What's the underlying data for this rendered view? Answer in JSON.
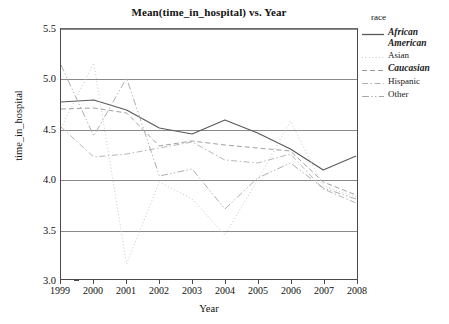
{
  "chart_data": {
    "type": "line",
    "title": "Mean(time_in_hospital) vs. Year",
    "xlabel": "Year",
    "ylabel": "time_in_hospital",
    "x": [
      1999,
      2000,
      2001,
      2002,
      2003,
      2004,
      2005,
      2006,
      2007,
      2008
    ],
    "xticklabels": [
      "1999",
      "2000",
      "2001",
      "2002",
      "2003",
      "2004",
      "2005",
      "2006",
      "2007",
      "2008"
    ],
    "yticklabels": [
      "3.0",
      "3.5",
      "4.0",
      "4.5",
      "5.0",
      "5.5"
    ],
    "ytickvalues": [
      3.0,
      3.5,
      4.0,
      4.5,
      5.0,
      5.5
    ],
    "xlim": [
      1999,
      2008
    ],
    "ylim": [
      3.0,
      5.5
    ],
    "grid": "horizontal",
    "legend_position": "right",
    "legend_title": "race",
    "series": [
      {
        "name": "African American",
        "style": "solid",
        "color": "#5a5a5a",
        "bold_label": true,
        "values": [
          4.77,
          4.79,
          4.69,
          4.51,
          4.45,
          4.59,
          4.46,
          4.3,
          4.09,
          4.23
        ]
      },
      {
        "name": "Asian",
        "style": "dotted",
        "color": "#c4c4c4",
        "bold_label": false,
        "values": [
          4.51,
          5.16,
          3.15,
          3.97,
          3.8,
          3.44,
          3.99,
          4.58,
          3.93,
          3.82
        ]
      },
      {
        "name": "Caucasian",
        "style": "dashed",
        "color": "#9a9a9a",
        "bold_label": true,
        "values": [
          4.7,
          4.71,
          4.66,
          4.33,
          4.38,
          4.34,
          4.31,
          4.28,
          3.97,
          3.84
        ]
      },
      {
        "name": "Hispanic",
        "style": "dashdot",
        "color": "#b0b0b0",
        "bold_label": false,
        "values": [
          4.52,
          4.22,
          4.25,
          4.31,
          4.37,
          4.19,
          4.16,
          4.25,
          3.9,
          3.76
        ]
      },
      {
        "name": "Other",
        "style": "dashdotdot",
        "color": "#a8a8a8",
        "bold_label": false,
        "values": [
          5.14,
          4.43,
          5.01,
          4.03,
          4.1,
          3.7,
          4.01,
          4.16,
          3.91,
          3.8
        ]
      }
    ]
  },
  "chart": {
    "title": "Mean(time_in_hospital) vs. Year",
    "x_axis_title": "Year",
    "y_axis_title": "time_in_hospital",
    "legend_title": "race",
    "legend_items": [
      {
        "label": "African American",
        "style": "solid"
      },
      {
        "label": "Asian",
        "style": "dotted"
      },
      {
        "label": "Caucasian",
        "style": "dashed"
      },
      {
        "label": "Hispanic",
        "style": "dashdot"
      },
      {
        "label": "Other",
        "style": "dashdotdot"
      }
    ]
  }
}
